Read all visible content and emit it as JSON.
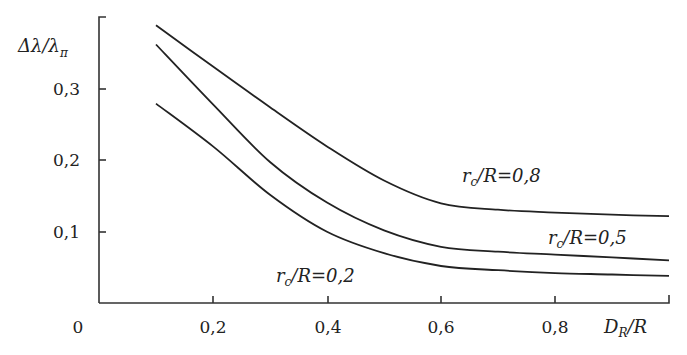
{
  "chart_data": {
    "type": "line",
    "title": "",
    "xlabel": "D_R/R",
    "ylabel": "Δλ/λ_π",
    "xlim": [
      0,
      1.0
    ],
    "ylim": [
      0,
      0.4
    ],
    "grid": false,
    "legend_position": "inline labels on curves",
    "x_ticks": [
      "0,2",
      "0,4",
      "0,6",
      "0,8"
    ],
    "y_ticks": [
      "0,1",
      "0,2",
      "0,3"
    ],
    "origin_label": "0",
    "x": [
      0.1,
      0.2,
      0.3,
      0.4,
      0.5,
      0.6,
      0.7,
      0.8,
      0.9,
      1.0
    ],
    "series": [
      {
        "name": "r_c/R = 0,8",
        "values": [
          0.39,
          0.332,
          0.275,
          0.22,
          0.172,
          0.14,
          0.131,
          0.127,
          0.124,
          0.122
        ]
      },
      {
        "name": "r_c/R = 0,5",
        "values": [
          0.363,
          0.279,
          0.198,
          0.141,
          0.102,
          0.079,
          0.072,
          0.068,
          0.064,
          0.06
        ]
      },
      {
        "name": "r_c/R = 0,2",
        "values": [
          0.28,
          0.22,
          0.152,
          0.1,
          0.07,
          0.052,
          0.046,
          0.042,
          0.04,
          0.038
        ]
      }
    ],
    "annotations": [
      {
        "text": "r_c/R=0,8",
        "near_x": 0.75,
        "near_y": 0.165
      },
      {
        "text": "r_c/R=0,5",
        "near_x": 0.93,
        "near_y": 0.085
      },
      {
        "text": "r_c/R=0,2",
        "near_x": 0.4,
        "near_y": 0.05
      }
    ]
  },
  "labels": {
    "ylabel_main": "Δλ/λ",
    "ylabel_sub": "π",
    "xlabel_main": "D",
    "xlabel_sub": "R",
    "xlabel_tail": "/R",
    "origin": "0",
    "curve_labels": [
      {
        "r": "r",
        "sub": "c",
        "rest": "/R=0,8"
      },
      {
        "r": "r",
        "sub": "c",
        "rest": "/R=0,5"
      },
      {
        "r": "r",
        "sub": "c",
        "rest": "/R=0,2"
      }
    ],
    "xticks": [
      "0,2",
      "0,4",
      "0,6",
      "0,8"
    ],
    "yticks": [
      "0,1",
      "0,2",
      "0,3"
    ]
  }
}
